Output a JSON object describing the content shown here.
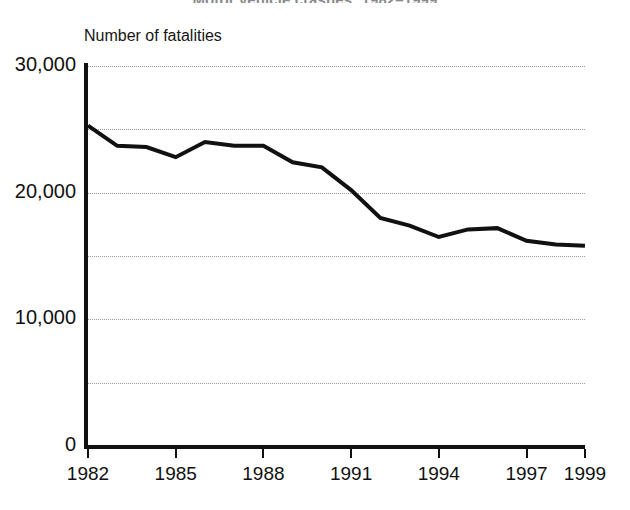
{
  "chart_data": {
    "type": "line",
    "title": "Motor vehicle crashes: 1982–1999",
    "subtitle": "",
    "ylabel": "Number of fatalities",
    "xlabel": "",
    "ylim": [
      0,
      30000
    ],
    "xlim": [
      1982,
      1999
    ],
    "grid": "horizontal-dotted",
    "legend": "none",
    "y_ticks": [
      {
        "value": 30000,
        "label": "30,000",
        "major": true
      },
      {
        "value": 25000,
        "label": "",
        "major": false
      },
      {
        "value": 20000,
        "label": "20,000",
        "major": true
      },
      {
        "value": 15000,
        "label": "",
        "major": false
      },
      {
        "value": 10000,
        "label": "10,000",
        "major": true
      },
      {
        "value": 5000,
        "label": "",
        "major": false
      },
      {
        "value": 0,
        "label": "0",
        "major": true
      }
    ],
    "x_ticks": [
      {
        "value": 1982,
        "label": "1982"
      },
      {
        "value": 1985,
        "label": "1985"
      },
      {
        "value": 1988,
        "label": "1988"
      },
      {
        "value": 1991,
        "label": "1991"
      },
      {
        "value": 1994,
        "label": "1994"
      },
      {
        "value": 1997,
        "label": "1997"
      },
      {
        "value": 1999,
        "label": "1999"
      }
    ],
    "x": [
      1982,
      1983,
      1984,
      1985,
      1986,
      1987,
      1988,
      1989,
      1990,
      1991,
      1992,
      1993,
      1994,
      1995,
      1996,
      1997,
      1998,
      1999
    ],
    "series": [
      {
        "name": "Number of fatalities",
        "color": "#111111",
        "values": [
          25300,
          23700,
          23600,
          22800,
          24000,
          23700,
          23700,
          22400,
          22000,
          20200,
          18000,
          17400,
          16500,
          17100,
          17200,
          16200,
          15900,
          15800
        ]
      }
    ]
  },
  "axis": {
    "y_caption": "Number of fatalities"
  },
  "colors": {
    "line": "#111111",
    "axis": "#111111",
    "grid": "#9a9a9a",
    "background": "#ffffff"
  }
}
